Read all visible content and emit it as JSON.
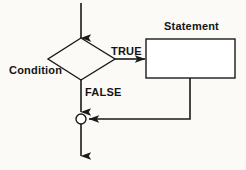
{
  "diagram": {
    "type": "flowchart",
    "background_color": "#fbfaf7",
    "line_color": "#1a1a1a",
    "text_color": "#141414",
    "nodes": {
      "decision": {
        "label": "Condition",
        "shape": "diamond",
        "center_x": 81,
        "center_y": 59,
        "width": 67,
        "height": 42
      },
      "process": {
        "label": "Statement",
        "shape": "rectangle",
        "x": 146,
        "y": 39,
        "width": 89,
        "height": 39,
        "fill": "#ffffff"
      },
      "merge": {
        "label": "",
        "shape": "circle",
        "center_x": 81,
        "center_y": 119,
        "radius": 5,
        "fill": "#ffffff"
      }
    },
    "edges": {
      "entry": {
        "label": "",
        "from": "top",
        "to": "decision"
      },
      "true_branch": {
        "label": "TRUE",
        "from": "decision",
        "to": "process"
      },
      "false_branch": {
        "label": "FALSE",
        "from": "decision",
        "to": "merge"
      },
      "return_branch": {
        "label": "",
        "from": "process",
        "to": "merge"
      },
      "exit": {
        "label": "",
        "from": "merge",
        "to": "bottom"
      }
    }
  }
}
